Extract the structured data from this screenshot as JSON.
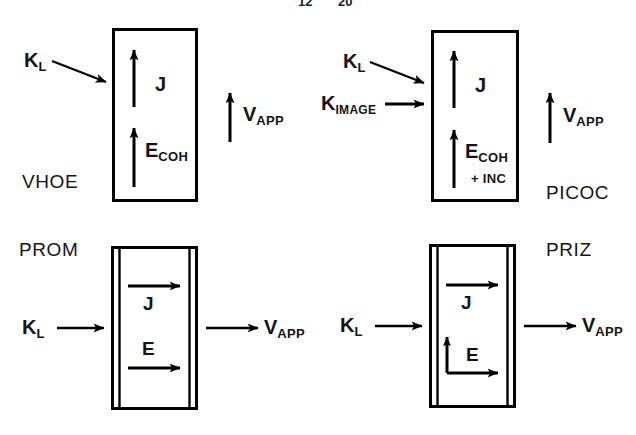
{
  "figure": {
    "type": "schematic-diagram",
    "background_color": "#ffffff",
    "ink_color": "#000000",
    "clipped_header": {
      "digit_left": "12",
      "digit_right": "20"
    }
  },
  "panels": [
    {
      "id": "vhoe",
      "name_label": "VHOE",
      "device_box": {
        "style": "single-outline"
      },
      "inputs": [
        {
          "symbol": "K",
          "subscript": "L",
          "arrow": "diagonal-down-right"
        }
      ],
      "internal_fields": [
        {
          "symbol": "J",
          "subscript": "",
          "arrow": "up"
        },
        {
          "symbol": "E",
          "subscript": "COH",
          "arrow": "up"
        }
      ],
      "output": {
        "symbol": "V",
        "subscript": "APP",
        "arrow": "up"
      }
    },
    {
      "id": "picoc",
      "name_label": "PICOC",
      "device_box": {
        "style": "single-outline"
      },
      "inputs": [
        {
          "symbol": "K",
          "subscript": "L",
          "arrow": "diagonal-down-right"
        },
        {
          "symbol": "K",
          "subscript": "IMAGE",
          "arrow": "right"
        }
      ],
      "internal_fields": [
        {
          "symbol": "J",
          "subscript": "",
          "arrow": "up"
        },
        {
          "symbol": "E",
          "subscript": "COH",
          "extra": "+ INC",
          "arrow": "up"
        }
      ],
      "output": {
        "symbol": "V",
        "subscript": "APP",
        "arrow": "up"
      }
    },
    {
      "id": "prom",
      "name_label": "PROM",
      "device_box": {
        "style": "double-outline-sandwich"
      },
      "inputs": [
        {
          "symbol": "K",
          "subscript": "L",
          "arrow": "right"
        }
      ],
      "internal_fields": [
        {
          "symbol": "J",
          "subscript": "",
          "arrow": "right"
        },
        {
          "symbol": "E",
          "subscript": "",
          "arrow": "right"
        }
      ],
      "output": {
        "symbol": "V",
        "subscript": "APP",
        "arrow": "right"
      }
    },
    {
      "id": "priz",
      "name_label": "PRIZ",
      "device_box": {
        "style": "double-outline-sandwich"
      },
      "inputs": [
        {
          "symbol": "K",
          "subscript": "L",
          "arrow": "right"
        }
      ],
      "internal_fields": [
        {
          "symbol": "J",
          "subscript": "",
          "arrow": "right"
        },
        {
          "symbol": "E",
          "subscript": "",
          "arrow": "L-shaped-up-and-right"
        }
      ],
      "output": {
        "symbol": "V",
        "subscript": "APP",
        "arrow": "right"
      }
    }
  ]
}
